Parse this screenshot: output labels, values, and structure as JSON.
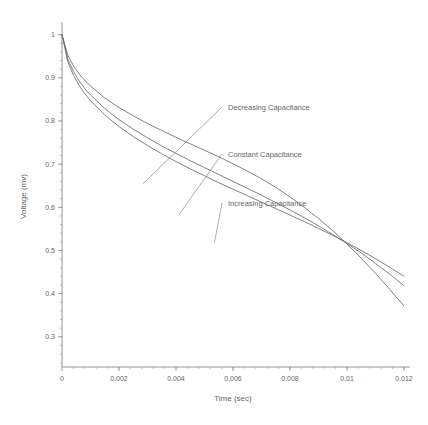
{
  "chart_data": {
    "type": "line",
    "title": "",
    "xlabel": "Time (sec)",
    "ylabel": "Voltage (mv)",
    "xlim": [
      0,
      0.012
    ],
    "ylim": [
      0.23,
      1.02
    ],
    "grid": false,
    "legend_position": "inline-annotations",
    "xticks": [
      0,
      0.002,
      0.004,
      0.006,
      0.008,
      0.01,
      0.012
    ],
    "xtick_labels": [
      "0",
      "0.002",
      "0.004",
      "0.006",
      "0.008",
      "0.01",
      "0.012"
    ],
    "yticks": [
      0.3,
      0.4,
      0.5,
      0.6,
      0.7,
      0.8,
      0.9,
      1
    ],
    "ytick_labels": [
      "0.3",
      "0.4",
      "0.5",
      "0.6",
      "0.7",
      "0.8",
      "0.9",
      "1"
    ],
    "x": [
      0,
      0.0002,
      0.0004,
      0.0006,
      0.0008,
      0.001,
      0.0015,
      0.002,
      0.0025,
      0.003,
      0.0035,
      0.004,
      0.0045,
      0.005,
      0.0055,
      0.006,
      0.0065,
      0.007,
      0.0075,
      0.008,
      0.0085,
      0.009,
      0.0095,
      0.01,
      0.0105,
      0.011,
      0.0115,
      0.012
    ],
    "series": [
      {
        "name": "Decreasing Capacitance",
        "color": "#6a6a6a",
        "values": [
          1.0,
          0.953,
          0.928,
          0.909,
          0.894,
          0.881,
          0.853,
          0.831,
          0.812,
          0.794,
          0.778,
          0.762,
          0.747,
          0.732,
          0.717,
          0.701,
          0.684,
          0.666,
          0.646,
          0.624,
          0.6,
          0.574,
          0.546,
          0.515,
          0.482,
          0.447,
          0.41,
          0.371
        ],
        "label_point": [
          0.00285,
          0.655
        ]
      },
      {
        "name": "Constant Capacitance",
        "color": "#6a6a6a",
        "values": [
          1.0,
          0.944,
          0.915,
          0.893,
          0.875,
          0.86,
          0.829,
          0.803,
          0.781,
          0.761,
          0.742,
          0.725,
          0.708,
          0.692,
          0.676,
          0.66,
          0.644,
          0.628,
          0.611,
          0.594,
          0.576,
          0.557,
          0.537,
          0.516,
          0.494,
          0.47,
          0.445,
          0.418
        ],
        "label_point": [
          0.0041,
          0.582
        ]
      },
      {
        "name": "Increasing Capacitance",
        "color": "#6a6a6a",
        "values": [
          1.0,
          0.938,
          0.906,
          0.882,
          0.863,
          0.847,
          0.814,
          0.787,
          0.764,
          0.743,
          0.724,
          0.706,
          0.689,
          0.673,
          0.657,
          0.642,
          0.627,
          0.612,
          0.597,
          0.582,
          0.567,
          0.551,
          0.535,
          0.518,
          0.5,
          0.481,
          0.461,
          0.44
        ],
        "label_point": [
          0.00535,
          0.518
        ]
      }
    ],
    "annotations": [
      {
        "text": "Decreasing Capacitance",
        "target_series": "Decreasing Capacitance"
      },
      {
        "text": "Constant Capacitance",
        "target_series": "Constant Capacitance"
      },
      {
        "text": "Increasing Capacitance",
        "target_series": "Increasing Capacitance"
      }
    ]
  }
}
